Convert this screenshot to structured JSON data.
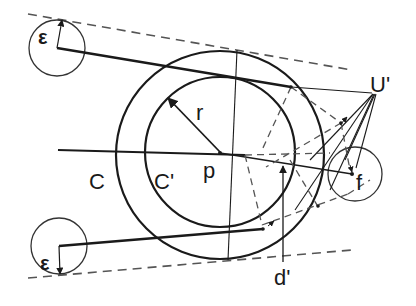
{
  "diagram": {
    "type": "geometric-construction",
    "labels": {
      "epsilon_top": "ε",
      "epsilon_bottom": "ε",
      "r": "r",
      "p": "p",
      "C": "C",
      "C_prime": "C'",
      "U_prime": "U'",
      "f": "f",
      "d_prime": "d'"
    },
    "colors": {
      "ink": "#1a1a1a",
      "dashed": "#555555",
      "background": "#ffffff"
    }
  }
}
